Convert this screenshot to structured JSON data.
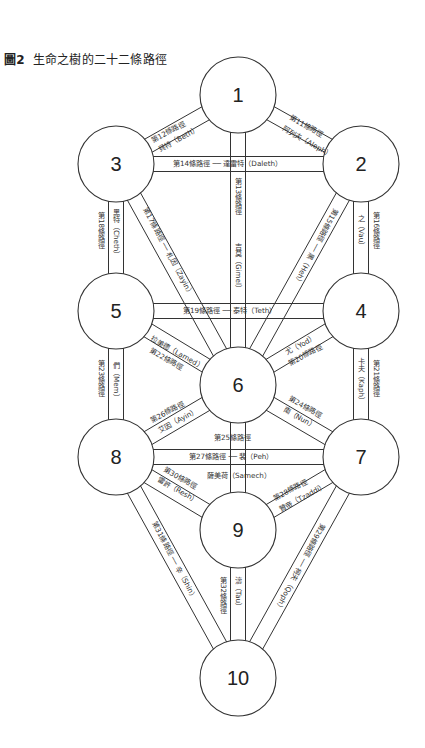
{
  "figure": {
    "number_label": "圖2",
    "title": "生命之樹的二十二條路徑"
  },
  "sephiroth": [
    {
      "id": 1,
      "label": "1",
      "cx": 238,
      "cy": 95
    },
    {
      "id": 2,
      "label": "2",
      "cx": 361,
      "cy": 164
    },
    {
      "id": 3,
      "label": "3",
      "cx": 116,
      "cy": 164
    },
    {
      "id": 4,
      "label": "4",
      "cx": 361,
      "cy": 311
    },
    {
      "id": 5,
      "label": "5",
      "cx": 116,
      "cy": 311
    },
    {
      "id": 6,
      "label": "6",
      "cx": 238,
      "cy": 385
    },
    {
      "id": 7,
      "label": "7",
      "cx": 361,
      "cy": 457
    },
    {
      "id": 8,
      "label": "8",
      "cx": 116,
      "cy": 457
    },
    {
      "id": 9,
      "label": "9",
      "cx": 238,
      "cy": 530
    },
    {
      "id": 10,
      "label": "10",
      "cx": 238,
      "cy": 678
    }
  ],
  "radius": 38,
  "paths": [
    {
      "num": 11,
      "from": 1,
      "to": 2,
      "path_label": "第11條路徑",
      "letter_label": "阿列夫（Aleph）"
    },
    {
      "num": 12,
      "from": 1,
      "to": 3,
      "path_label": "第12條路徑",
      "letter_label": "貝特（Beth）"
    },
    {
      "num": 13,
      "from": 1,
      "to": 6,
      "path_label": "第13條路徑",
      "letter_label": "吉莫（Gimel）"
    },
    {
      "num": 14,
      "from": 3,
      "to": 2,
      "path_label": "第14條路徑",
      "letter_label": "達雷特（Daleth）"
    },
    {
      "num": 15,
      "from": 2,
      "to": 6,
      "path_label": "第15條路徑",
      "letter_label": "黑（Heh）"
    },
    {
      "num": 16,
      "from": 2,
      "to": 4,
      "path_label": "第16條路徑",
      "letter_label": "之（Vau）"
    },
    {
      "num": 17,
      "from": 3,
      "to": 6,
      "path_label": "第17條路徑",
      "letter_label": "札因（Zayin）"
    },
    {
      "num": 18,
      "from": 3,
      "to": 5,
      "path_label": "第18條路徑",
      "letter_label": "黑特（Cheth）"
    },
    {
      "num": 19,
      "from": 5,
      "to": 4,
      "path_label": "第19條路徑",
      "letter_label": "泰特（Teth）"
    },
    {
      "num": 20,
      "from": 4,
      "to": 6,
      "path_label": "第20條路徑",
      "letter_label": "尤（Yod）"
    },
    {
      "num": 21,
      "from": 4,
      "to": 7,
      "path_label": "第21條路徑",
      "letter_label": "卡夫（Kaph）"
    },
    {
      "num": 22,
      "from": 5,
      "to": 6,
      "path_label": "第22條路徑",
      "letter_label": "拉美德（Lamed）"
    },
    {
      "num": 23,
      "from": 5,
      "to": 8,
      "path_label": "第23條路徑",
      "letter_label": "們（Mem）"
    },
    {
      "num": 24,
      "from": 6,
      "to": 7,
      "path_label": "第24條路徑",
      "letter_label": "南（Nun）"
    },
    {
      "num": 25,
      "from": 6,
      "to": 9,
      "path_label": "第25條路徑",
      "letter_label": "薩美荷（Samech）"
    },
    {
      "num": 26,
      "from": 6,
      "to": 8,
      "path_label": "第26條路徑",
      "letter_label": "艾因（Ayin）"
    },
    {
      "num": 27,
      "from": 8,
      "to": 7,
      "path_label": "第27條路徑",
      "letter_label": "裴（Peh）"
    },
    {
      "num": 28,
      "from": 7,
      "to": 9,
      "path_label": "第28條路徑",
      "letter_label": "贊帝（Tzaddi）"
    },
    {
      "num": 29,
      "from": 7,
      "to": 10,
      "path_label": "第29條路徑",
      "letter_label": "柯夫（Qoph）"
    },
    {
      "num": 30,
      "from": 8,
      "to": 9,
      "path_label": "第30條路徑",
      "letter_label": "雷許（Resh）"
    },
    {
      "num": 31,
      "from": 8,
      "to": 10,
      "path_label": "第31條路徑",
      "letter_label": "辛（Shin）"
    },
    {
      "num": 32,
      "from": 9,
      "to": 10,
      "path_label": "第32條路徑",
      "letter_label": "濤（Tau）"
    }
  ],
  "labels": {
    "p11a": "第11條路徑",
    "p11b": "阿列夫（Aleph）",
    "p12a": "第12條路徑",
    "p12b": "貝特（Beth）",
    "p13a": "第13條路徑",
    "p13b": "吉莫（Gimel）",
    "p14": "第14條路徑 ── 達雷特（Daleth）",
    "p15": "第15條路徑 ── 黑（Heh）",
    "p16a": "第16條路徑",
    "p16b": "之（Vau）",
    "p17": "第17條路徑 ── 札因（Zayin）",
    "p18a": "第18條路徑",
    "p18b": "黑特（Cheth）",
    "p19": "第19條路徑 ── 泰特（Teth）",
    "p20a": "尤（Yod）",
    "p20b": "第20條路徑",
    "p21a": "第21條路徑",
    "p21b": "卡夫（Kaph）",
    "p22a": "拉美德（Lamed）",
    "p22b": "第22條路徑",
    "p23a": "第23條路徑",
    "p23b": "們（Mem）",
    "p24a": "第24條路徑",
    "p24b": "南（Nun）",
    "p25a": "第25條路徑",
    "p25b": "薩美荷（Samech）",
    "p26a": "第26條路徑",
    "p26b": "艾因（Ayin）",
    "p27": "第27條路徑 ── 裴（Peh）",
    "p28a": "第28條路徑",
    "p28b": "贊帝（Tzaddi）",
    "p29": "第29條路徑 ── 柯夫（Qoph）",
    "p30a": "第30條路徑",
    "p30b": "雷許（Resh）",
    "p31": "第31條路徑 ── 辛（Shin）",
    "p32a": "第32條路徑",
    "p32b": "濤（Tau）"
  }
}
